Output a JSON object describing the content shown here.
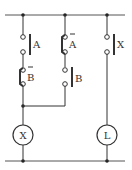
{
  "diagram": {
    "type": "relay-ladder-circuit",
    "colors": {
      "line": "#333333",
      "background": "#ffffff"
    },
    "rails": {
      "top": {
        "y": 15
      },
      "bottom": {
        "y": 161
      }
    },
    "contacts": [
      {
        "id": "A",
        "label": "A",
        "type": "normally-open",
        "overline": false
      },
      {
        "id": "B_bar",
        "label": "B",
        "type": "normally-closed",
        "overline": true
      },
      {
        "id": "A_bar",
        "label": "A",
        "type": "normally-closed",
        "overline": true
      },
      {
        "id": "B",
        "label": "B",
        "type": "normally-open",
        "overline": false
      },
      {
        "id": "X_contact",
        "label": "X",
        "type": "normally-open",
        "overline": false
      }
    ],
    "coils": [
      {
        "id": "X",
        "label": "X"
      },
      {
        "id": "L",
        "label": "L"
      }
    ]
  }
}
